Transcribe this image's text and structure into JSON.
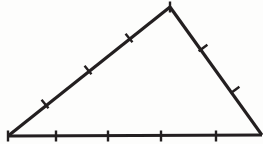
{
  "figure": {
    "type": "geometric-diagram",
    "shape": "triangle",
    "background_color": "#fdfdfc",
    "stroke_color": "#231f20",
    "edge_stroke_width": 3.2,
    "tick_stroke_width": 2.4,
    "tick_half_length": 5.5,
    "canvas": {
      "width": 263,
      "height": 144
    },
    "vertices": {
      "bottom_left": {
        "label": "A",
        "x": 8,
        "y": 136
      },
      "apex": {
        "label": "B",
        "x": 170,
        "y": 7
      },
      "bottom_right": {
        "label": "C",
        "x": 262,
        "y": 135
      }
    },
    "edges": [
      {
        "name": "base-edge",
        "from": "bottom_left",
        "to": "bottom_right",
        "orientation": "horizontal",
        "tick_count": 5,
        "tick_style": "vertical"
      },
      {
        "name": "left-edge",
        "from": "bottom_left",
        "to": "apex",
        "orientation": "ascending",
        "tick_count": 4,
        "tick_style": "perpendicular"
      },
      {
        "name": "right-edge",
        "from": "apex",
        "to": "bottom_right",
        "orientation": "descending",
        "tick_count": 2,
        "tick_style": "perpendicular"
      }
    ],
    "ticks": {
      "base_edge": [
        {
          "name": "base-tick-0",
          "x": 8,
          "y": 136,
          "angle_deg": 90
        },
        {
          "name": "base-tick-1",
          "x": 56,
          "y": 136,
          "angle_deg": 90
        },
        {
          "name": "base-tick-2",
          "x": 108,
          "y": 136,
          "angle_deg": 90
        },
        {
          "name": "base-tick-3",
          "x": 161,
          "y": 136,
          "angle_deg": 90
        },
        {
          "name": "base-tick-4",
          "x": 216,
          "y": 136,
          "angle_deg": 90
        }
      ],
      "left_edge": [
        {
          "name": "left-tick-1",
          "x": 45,
          "y": 104,
          "angle_deg": 51
        },
        {
          "name": "left-tick-2",
          "x": 88,
          "y": 70,
          "angle_deg": 51
        },
        {
          "name": "left-tick-3",
          "x": 129,
          "y": 38,
          "angle_deg": 51
        },
        {
          "name": "left-tick-4",
          "x": 170,
          "y": 7,
          "angle_deg": 90
        }
      ],
      "right_edge": [
        {
          "name": "right-tick-1",
          "x": 203,
          "y": 48,
          "angle_deg": 143
        },
        {
          "name": "right-tick-2",
          "x": 235,
          "y": 90,
          "angle_deg": 143
        }
      ]
    }
  }
}
